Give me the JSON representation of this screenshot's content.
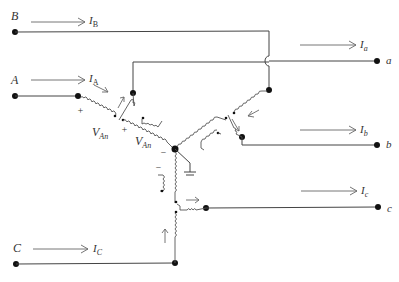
{
  "diagram": {
    "title": "",
    "type": "three-phase autotransformer / phase shifting circuit",
    "input_terminals": [
      {
        "name": "B",
        "current": "I",
        "current_sub": "B"
      },
      {
        "name": "A",
        "current": "I",
        "current_sub": "A"
      },
      {
        "name": "C",
        "current": "I",
        "current_sub": "C"
      }
    ],
    "output_terminals": [
      {
        "name": "a",
        "current": "I",
        "current_sub": "a"
      },
      {
        "name": "b",
        "current": "I",
        "current_sub": "b"
      },
      {
        "name": "c",
        "current": "I",
        "current_sub": "c"
      }
    ],
    "voltage_labels": [
      {
        "text": "V",
        "sub": "An"
      },
      {
        "text": "V",
        "sub": "An"
      }
    ],
    "polarity_marks": [
      "+",
      "+",
      "−",
      "−"
    ],
    "colors": {
      "wire": "#444444",
      "node": "#111111",
      "text": "#333333"
    }
  }
}
